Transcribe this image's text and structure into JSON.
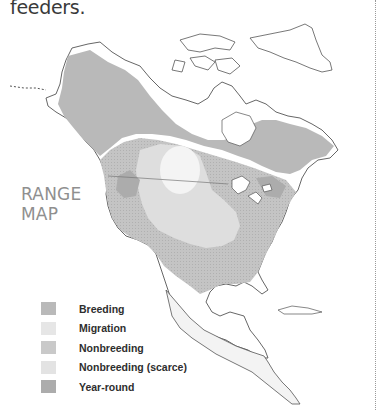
{
  "intro": {
    "text": "feeders."
  },
  "range_map": {
    "title_line1": "RANGE",
    "title_line2": "MAP"
  },
  "legend": {
    "items": [
      {
        "label": "Breeding",
        "color": "#b9b9b9"
      },
      {
        "label": "Migration",
        "color": "#e6e6e6"
      },
      {
        "label": "Nonbreeding",
        "color": "#c9c9c9"
      },
      {
        "label": "Nonbreeding (scarce)",
        "color": "#e3e3e3"
      },
      {
        "label": "Year-round",
        "color": "#acacac"
      }
    ]
  },
  "map": {
    "region": "North America",
    "colors": {
      "breeding": "#b9b9b9",
      "migration": "#e6e6e6",
      "nonbreeding": "#c9c9c9",
      "scarce": "#e3e3e3",
      "year_round": "#acacac",
      "outline": "#555555"
    }
  }
}
